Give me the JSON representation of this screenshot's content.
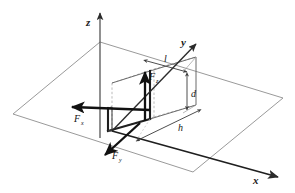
{
  "figure": {
    "background_color": "#ffffff"
  },
  "colors": {
    "plane_stroke": "#9a9a9a",
    "hidden_edge": "#b0b0b0",
    "solid_edge": "#2b2b2b",
    "force_vector": "#111111",
    "axis": "#3c3c3c",
    "dimension": "#555555",
    "text": "#1a1a1a"
  },
  "axes": [
    {
      "id": "z",
      "label": "z",
      "direction": "up",
      "label_x": 88,
      "label_y": 22
    },
    {
      "id": "y",
      "label": "y",
      "direction": "up-right",
      "label_x": 182,
      "label_y": 46
    },
    {
      "id": "x",
      "label": "x",
      "direction": "down-right",
      "label_x": 254,
      "label_y": 182
    }
  ],
  "forces": [
    {
      "id": "Fx",
      "base": "F",
      "subscript": "x",
      "label_x": 74,
      "label_y": 122,
      "direction": "left"
    },
    {
      "id": "Fy",
      "base": "F",
      "subscript": "y",
      "label_x": 112,
      "label_y": 159,
      "direction": "down-left"
    },
    {
      "id": "Fz",
      "base": "F",
      "subscript": "z",
      "label_x": 148,
      "label_y": 80,
      "direction": "up"
    }
  ],
  "dimensions": [
    {
      "id": "l",
      "label": "l",
      "label_x": 163,
      "label_y": 62,
      "description": "length along top edge"
    },
    {
      "id": "d",
      "label": "d",
      "label_x": 191,
      "label_y": 96,
      "description": "depth on right side"
    },
    {
      "id": "h",
      "label": "h",
      "label_x": 178,
      "label_y": 130,
      "description": "height along lower right edge"
    }
  ],
  "plane": {
    "name": "ground-plane",
    "points": "100,42 283,98 193,172 13,114"
  },
  "box": {
    "name": "rectangular-block",
    "front_bottom_left": "108,131",
    "front_bottom_right": "150,119",
    "back_bottom_right": "196,105",
    "top_height": 48
  }
}
